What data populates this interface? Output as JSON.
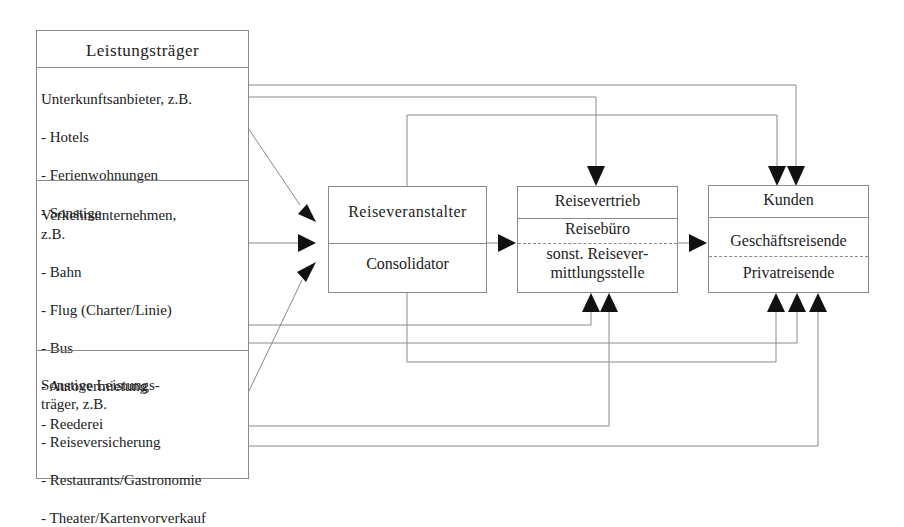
{
  "diagram": {
    "providers": {
      "title": "Leistungsträger",
      "groups": [
        {
          "heading": "Unterkunftsanbieter, z.B.",
          "items": [
            "- Hotels",
            "- Ferienwohnungen",
            "- Sonstige"
          ]
        },
        {
          "heading": "Verkehrsunternehmen,\nz.B.",
          "items": [
            "- Bahn",
            "- Flug (Charter/Linie)",
            "- Bus",
            "- Autovermietung",
            "- Reederei"
          ]
        },
        {
          "heading": "Sonstige Leistungs-\nträger, z.B.",
          "items": [
            "- Reiseversicherung",
            "- Restaurants/Gastronomie",
            "- Theater/Kartenvorverkauf"
          ]
        }
      ]
    },
    "operator": {
      "top": "Reiseveranstalter",
      "bottom": "Consolidator"
    },
    "distribution": {
      "title": "Reisevertrieb",
      "part1": "Reisebüro",
      "part2": "sonst. Reisever-\nmittlungsstelle"
    },
    "customers": {
      "title": "Kunden",
      "part1": "Geschäftsreisende",
      "part2": "Privatreisende"
    },
    "colors": {
      "line": "#8a8a8a",
      "arrow": "#111111",
      "background": "#ffffff"
    }
  }
}
